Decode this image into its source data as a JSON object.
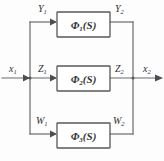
{
  "figure": {
    "type": "block-diagram",
    "background_color": "#fdfdfd",
    "line_color": "#6b6b6d",
    "block_border_color": "#58585a",
    "text_color": "#2f2f31"
  },
  "blocks": [
    {
      "id": "phi1",
      "symbol": "Φ",
      "subscript": "1",
      "argument": "(S)",
      "label": "Φ₁(S)",
      "row": "top"
    },
    {
      "id": "phi2",
      "symbol": "Φ",
      "subscript": "2",
      "argument": "(S)",
      "label": "Φ₂(S)",
      "row": "middle"
    },
    {
      "id": "phi3",
      "symbol": "Φ",
      "subscript": "3",
      "argument": "(S)",
      "label": "Φ₃(S)",
      "row": "bottom"
    }
  ],
  "signals": {
    "input": {
      "base": "x",
      "sub": "1",
      "label": "x₁"
    },
    "output": {
      "base": "x",
      "sub": "2",
      "label": "x₂"
    },
    "top_in": {
      "base": "Y",
      "sub": "1",
      "label": "Y₁"
    },
    "top_out": {
      "base": "Y",
      "sub": "2",
      "label": "Y₂"
    },
    "mid_in": {
      "base": "Z",
      "sub": "1",
      "label": "Z₁"
    },
    "mid_out": {
      "base": "Z",
      "sub": "2",
      "label": "Z₂"
    },
    "bot_in": {
      "base": "W",
      "sub": "1",
      "label": "W₁"
    },
    "bot_out": {
      "base": "W",
      "sub": "2",
      "label": "W₂"
    }
  }
}
